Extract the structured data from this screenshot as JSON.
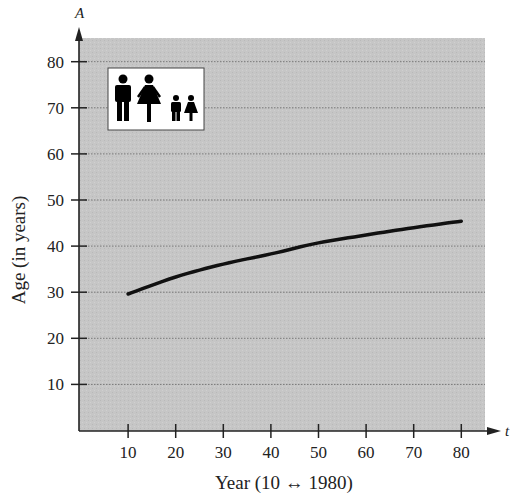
{
  "chart_data": {
    "type": "line",
    "title": "",
    "xlabel": "Year (10 ↔ 1980)",
    "ylabel": "Age (in years)",
    "x_axis_var": "t",
    "y_axis_var": "A",
    "xlim": [
      0,
      85
    ],
    "ylim": [
      0,
      85
    ],
    "x_ticks": [
      10,
      20,
      30,
      40,
      50,
      60,
      70,
      80
    ],
    "y_ticks": [
      10,
      20,
      30,
      40,
      50,
      60,
      70,
      80
    ],
    "grid": "horizontal dotted",
    "legend": "none",
    "annotation": "family icon box (man, woman, boy, girl)",
    "series": [
      {
        "name": "Median age",
        "x": [
          10,
          20,
          30,
          40,
          50,
          60,
          70,
          80
        ],
        "values": [
          29.6,
          33.3,
          36.1,
          38.3,
          40.7,
          42.4,
          44.0,
          45.4
        ]
      }
    ]
  },
  "colors": {
    "plot_background": "#c4c4c4",
    "gridline": "#777777",
    "curve": "#111111",
    "axis": "#222222"
  }
}
